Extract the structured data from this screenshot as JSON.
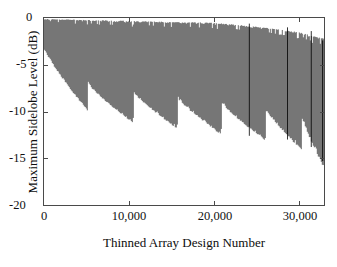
{
  "chart_data": {
    "type": "line",
    "title": "",
    "xlabel": "Thinned Array Design Number",
    "ylabel": "Maximum Sidelobe Level (dB)",
    "xlim": [
      0,
      33000
    ],
    "ylim": [
      -20,
      0
    ],
    "xticks": [
      0,
      10000,
      20000,
      30000
    ],
    "xtick_labels": [
      "0",
      "10,000",
      "20,000",
      "30,000"
    ],
    "yticks": [
      -20,
      -15,
      -10,
      -5,
      0
    ],
    "ytick_labels": [
      "-20",
      "-15",
      "-10",
      "-5",
      "0"
    ],
    "grid": false,
    "legend": null,
    "series_color": "#000000",
    "axis_color": "#4a4a4a",
    "n_points": 33000,
    "upper_envelope": {
      "x": [
        0,
        5000,
        10000,
        15000,
        20000,
        25000,
        30000,
        33000
      ],
      "y": [
        -0.1,
        -0.2,
        -0.3,
        -0.4,
        -0.5,
        -0.9,
        -1.5,
        -2.2
      ]
    },
    "lower_envelope_sawtooth": {
      "segment_starts": [
        0,
        5200,
        10500,
        15700,
        20900,
        26100,
        30400
      ],
      "segment_start_y": [
        -3.0,
        -6.6,
        -7.4,
        -8.0,
        -8.5,
        -9.2,
        -10.0
      ],
      "segment_end_y": [
        -9.4,
        -10.6,
        -11.2,
        -11.8,
        -12.4,
        -13.4,
        -15.2
      ]
    },
    "overall_trend": {
      "x": [
        0,
        10000,
        20000,
        30000,
        33000
      ],
      "min_y": [
        -5.0,
        -10.5,
        -12.0,
        -13.6,
        -15.3
      ]
    }
  },
  "axes": {
    "y_labels": [
      "0",
      "-5",
      "-10",
      "-15",
      "-20"
    ],
    "x_labels": [
      "0",
      "10,000",
      "20,000",
      "30,000"
    ],
    "x_title": "Thinned Array Design Number",
    "y_title": "Maximum Sidelobe Level (dB)"
  }
}
